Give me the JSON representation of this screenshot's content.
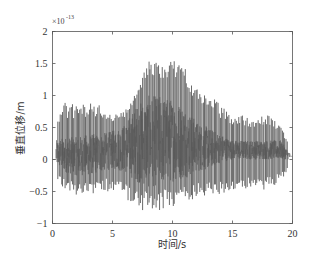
{
  "chart_data": {
    "type": "line",
    "title": "",
    "xlabel": "时间/s",
    "ylabel": "垂直位移/m",
    "y_exponent_label": "×10",
    "y_exponent_power": "-13",
    "xlim": [
      0,
      20
    ],
    "ylim": [
      -1,
      2
    ],
    "x_ticks": [
      0,
      5,
      10,
      15,
      20
    ],
    "x_tick_labels": [
      "0",
      "5",
      "10",
      "15",
      "20"
    ],
    "y_ticks": [
      -1,
      -0.5,
      0,
      0.5,
      1,
      1.5,
      2
    ],
    "y_tick_labels": [
      "-1",
      "-0.5",
      "0",
      "0.5",
      "1",
      "1.5",
      "2"
    ],
    "grid": false,
    "legend": null,
    "series": [
      {
        "name": "垂直位移",
        "color": "#595959",
        "signal_start_s": 0.3,
        "signal_end_s": 19.8,
        "envelope": {
          "t": [
            0.3,
            1,
            2,
            3,
            4,
            5,
            6,
            7,
            8,
            9,
            10,
            11,
            12,
            13,
            14,
            15,
            16,
            17,
            18,
            19,
            19.8
          ],
          "peak_max": [
            0.55,
            0.9,
            0.85,
            0.9,
            0.85,
            0.7,
            0.75,
            1.05,
            1.55,
            1.5,
            1.55,
            1.5,
            1.1,
            1.05,
            0.85,
            0.7,
            0.7,
            0.65,
            0.7,
            0.55,
            0.2
          ],
          "peak_min": [
            -0.3,
            -0.5,
            -0.55,
            -0.55,
            -0.5,
            -0.5,
            -0.6,
            -0.75,
            -0.85,
            -0.8,
            -0.75,
            -0.7,
            -0.6,
            -0.6,
            -0.55,
            -0.5,
            -0.45,
            -0.5,
            -0.45,
            -0.35,
            -0.1
          ],
          "band_max": [
            0.3,
            0.35,
            0.35,
            0.4,
            0.4,
            0.45,
            0.55,
            0.85,
            1.0,
            1.0,
            0.95,
            0.85,
            0.6,
            0.5,
            0.4,
            0.3,
            0.3,
            0.3,
            0.3,
            0.3,
            0.1
          ],
          "band_min": [
            -0.1,
            -0.2,
            -0.25,
            -0.25,
            -0.2,
            -0.15,
            -0.2,
            -0.35,
            -0.45,
            -0.4,
            -0.35,
            -0.3,
            -0.2,
            -0.15,
            -0.05,
            0.0,
            0.0,
            0.0,
            0.0,
            0.0,
            0.0
          ]
        }
      }
    ]
  }
}
